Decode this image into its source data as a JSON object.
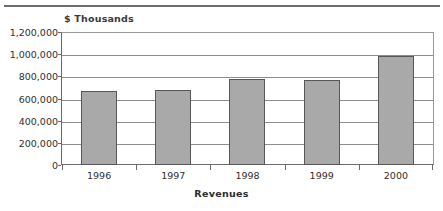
{
  "figure": {
    "unit_caption": "$ Thousands",
    "axis_title": "Revenues"
  },
  "chart_data": {
    "type": "bar",
    "title": "",
    "subtitle": "",
    "xlabel": "Revenues",
    "ylabel": "$ Thousands",
    "categories": [
      "1996",
      "1997",
      "1998",
      "1999",
      "2000"
    ],
    "values": [
      665000,
      675000,
      775000,
      765000,
      985000
    ],
    "series": [
      {
        "name": "Revenues",
        "values": [
          665000,
          675000,
          775000,
          765000,
          985000
        ]
      }
    ],
    "ylim": [
      0,
      1200000
    ],
    "ytick_labels": [
      "0",
      "200,000",
      "400,000",
      "600,000",
      "800,000",
      "1,000,000",
      "1,200,000"
    ],
    "ytick_values": [
      0,
      200000,
      400000,
      600000,
      800000,
      1000000,
      1200000
    ],
    "grid": true,
    "grid_axis": "y",
    "legend": false,
    "legend_position": "none",
    "bar_color": "#a9a9a9",
    "bar_edge_color": "#575757",
    "gridline_color": "#8d8d8d",
    "axis_color": "#6a6a6a",
    "annotations": []
  }
}
